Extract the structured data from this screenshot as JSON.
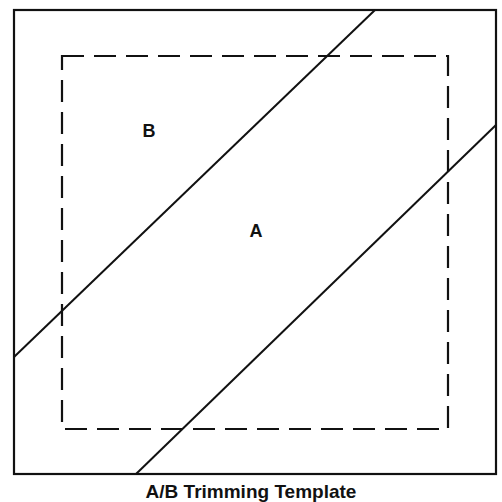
{
  "diagram": {
    "title": "A/B Trimming Template",
    "colors": {
      "stroke": "#111111",
      "background": "#ffffff"
    },
    "outer_square": {
      "x1": 14,
      "y1": 10,
      "x2": 496,
      "y2": 474,
      "style": "solid"
    },
    "inner_square": {
      "x1": 62,
      "y1": 56,
      "x2": 448,
      "y2": 429,
      "style": "dashed"
    },
    "cut_lines": [
      {
        "name": "upper-diagonal",
        "x1": 375,
        "y1": 10,
        "x2": 14,
        "y2": 357
      },
      {
        "name": "lower-diagonal",
        "x1": 496,
        "y1": 125,
        "x2": 136,
        "y2": 474
      }
    ],
    "labels": [
      {
        "text": "B",
        "x": 149,
        "y": 130
      },
      {
        "text": "A",
        "x": 256,
        "y": 231
      }
    ]
  }
}
